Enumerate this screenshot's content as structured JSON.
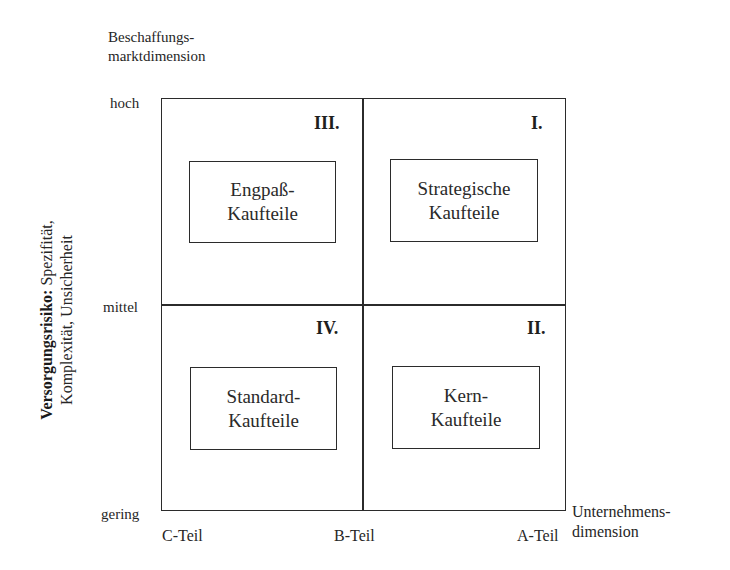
{
  "diagram": {
    "type": "portfolio-matrix-2x2",
    "y_axis": {
      "dimension_label_line1": "Beschaffungs-",
      "dimension_label_line2": "marktdimension",
      "title_bold": "Versorgungsrisiko:",
      "title_rest_line1": " Spezifität,",
      "title_line2": "Komplexität, Unsicherheit",
      "ticks": [
        "hoch",
        "mittel",
        "gering"
      ]
    },
    "x_axis": {
      "dimension_label_line1": "Unternehmens-",
      "dimension_label_line2": "dimension",
      "ticks": [
        "C-Teil",
        "B-Teil",
        "A-Teil"
      ]
    },
    "quadrants": {
      "top_left": {
        "numeral": "III.",
        "line1": "Engpaß-",
        "line2": "Kaufteile"
      },
      "top_right": {
        "numeral": "I.",
        "line1": "Strategische",
        "line2": "Kaufteile"
      },
      "bottom_left": {
        "numeral": "IV.",
        "line1": "Standard-",
        "line2": "Kaufteile"
      },
      "bottom_right": {
        "numeral": "II.",
        "line1": "Kern-",
        "line2": "Kaufteile"
      }
    }
  }
}
